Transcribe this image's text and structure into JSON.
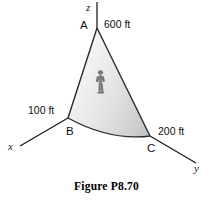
{
  "figure": {
    "caption": "Figure P8.70",
    "background_color": "#ffffff",
    "line_color": "#1a1a1a",
    "fill_light": "#f2f2f2",
    "fill_dark": "#c9c9c9",
    "axes": [
      {
        "id": "z",
        "label": "z",
        "direction": "up"
      },
      {
        "id": "x",
        "label": "x",
        "direction": "down-left"
      },
      {
        "id": "y",
        "label": "y",
        "direction": "down-right"
      }
    ],
    "points": [
      {
        "id": "A",
        "label": "A"
      },
      {
        "id": "B",
        "label": "B"
      },
      {
        "id": "C",
        "label": "C"
      }
    ],
    "dimensions": [
      {
        "id": "OA",
        "label": "600 ft",
        "value": 600,
        "unit": "ft",
        "along_axis": "z"
      },
      {
        "id": "OB",
        "label": "100 ft",
        "value": 100,
        "unit": "ft",
        "along_axis": "x"
      },
      {
        "id": "OC",
        "label": "200 ft",
        "value": 200,
        "unit": "ft",
        "along_axis": "y"
      }
    ],
    "person_icon": "person-figure-icon"
  }
}
